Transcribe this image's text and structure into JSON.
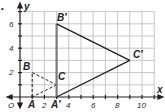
{
  "diagram": {
    "type": "coordinate-plane-transformation",
    "axes": {
      "x_label": "x",
      "y_label": "y",
      "origin_label": "O",
      "x_ticks": [
        "2",
        "4",
        "6",
        "8",
        "10"
      ],
      "y_ticks": [
        "2",
        "4",
        "6"
      ],
      "x_range": [
        0,
        11
      ],
      "y_range": [
        0,
        7
      ]
    },
    "original_triangle": {
      "style": "dashed",
      "vertices": [
        {
          "label": "A",
          "x": 1,
          "y": 0
        },
        {
          "label": "B",
          "x": 1,
          "y": 2
        },
        {
          "label": "C",
          "x": 3,
          "y": 1
        }
      ]
    },
    "image_triangle": {
      "style": "solid",
      "vertices": [
        {
          "label": "A′",
          "x": 3,
          "y": 0
        },
        {
          "label": "B′",
          "x": 3,
          "y": 6
        },
        {
          "label": "C′",
          "x": 9,
          "y": 3
        }
      ]
    },
    "bullet": "•",
    "colors": {
      "grid": "#b9b9b9",
      "axis": "#231f20",
      "shape": "#231f20",
      "highlight_segment": "#7a7a7a"
    }
  }
}
